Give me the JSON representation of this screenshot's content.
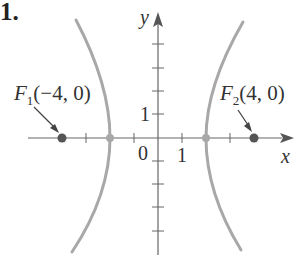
{
  "problem_number": "1.",
  "figure": {
    "type": "hyperbola",
    "equation": "x^2/4 - y^2/12 = 1",
    "axes": {
      "x_label": "x",
      "y_label": "y",
      "origin_label": "0",
      "x_unit_label": "1",
      "y_unit_label": "1",
      "x_ticks": [
        -3,
        -1,
        1,
        3
      ],
      "y_ticks": [
        -4,
        -3,
        -2,
        -1,
        1,
        2,
        3,
        4
      ]
    },
    "foci": [
      {
        "name": "F",
        "sub": "1",
        "coords": "(−4, 0)",
        "x": -4,
        "y": 0
      },
      {
        "name": "F",
        "sub": "2",
        "coords": "(4, 0)",
        "x": 4,
        "y": 0
      }
    ],
    "vertices": [
      {
        "x": -2,
        "y": 0
      },
      {
        "x": 2,
        "y": 0
      }
    ],
    "colors": {
      "curve": "#a8a8a8",
      "axis": "#666666",
      "focus_dot": "#555555",
      "vertex_dot": "#a8a8a8",
      "text": "#333333"
    }
  }
}
